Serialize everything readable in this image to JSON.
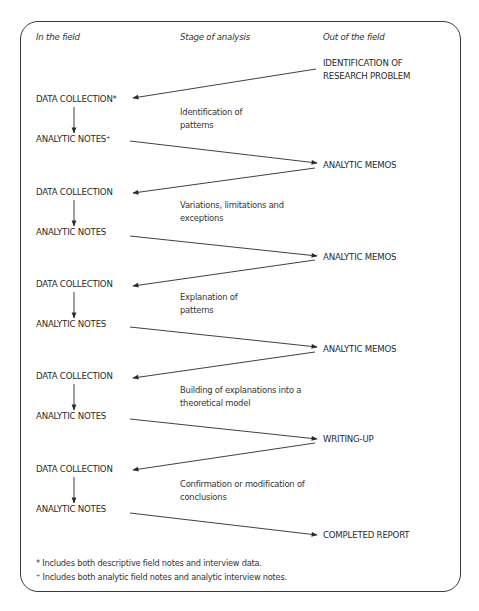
{
  "headers": {
    "in_field": "In the field",
    "stage": "Stage of analysis",
    "out_field": "Out of the field"
  },
  "start": {
    "line1": "IDENTIFICATION OF",
    "line2": "RESEARCH PROBLEM"
  },
  "cycles": [
    {
      "data_collection": "DATA COLLECTION*",
      "analytic_notes": "ANALYTIC NOTES⁺",
      "stage": "Identification of patterns",
      "output": "ANALYTIC MEMOS"
    },
    {
      "data_collection": "DATA COLLECTION",
      "analytic_notes": "ANALYTIC NOTES",
      "stage": "Variations, limitations and exceptions",
      "output": "ANALYTIC MEMOS"
    },
    {
      "data_collection": "DATA COLLECTION",
      "analytic_notes": "ANALYTIC NOTES",
      "stage": "Explanation of patterns",
      "output": "ANALYTIC MEMOS"
    },
    {
      "data_collection": "DATA COLLECTION",
      "analytic_notes": "ANALYTIC NOTES",
      "stage": "Building of explanations into a theoretical model",
      "output": "WRITING-UP"
    },
    {
      "data_collection": "DATA COLLECTION",
      "analytic_notes": "ANALYTIC NOTES",
      "stage": "Confirmation or modification of conclusions",
      "output": "COMPLETED REPORT"
    }
  ],
  "footnotes": {
    "asterisk": "* Includes both descriptive field notes and interview data.",
    "plus": "⁺ Includes both analytic field notes and analytic interview notes."
  },
  "colors": {
    "line": "#2a2a2a",
    "text": "#2a2a2a",
    "background": "#ffffff"
  }
}
